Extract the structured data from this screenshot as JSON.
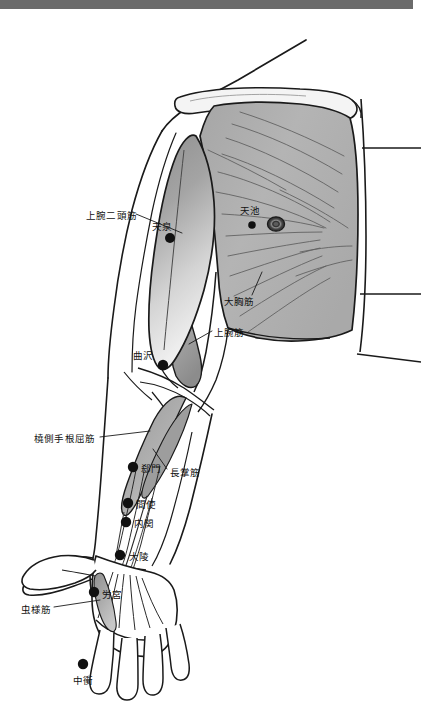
{
  "page": {
    "background_color": "#ffffff",
    "top_bar_color": "#6b6b6b",
    "width": 421,
    "height": 712
  },
  "colors": {
    "outline": "#1a1a1a",
    "muscle_gray": "#b0b0b0",
    "muscle_gray_dark": "#8d8d8d",
    "muscle_gray_light": "#cfcfcf",
    "biceps_top": "#9a9a9a",
    "biceps_bottom": "#e8e8e8",
    "point_fill": "#111111",
    "label_text": "#111111"
  },
  "figure": {
    "view": "anterior-right-upper-limb-and-chest"
  },
  "muscle_labels": [
    {
      "id": "biceps-brachii",
      "text": "上腕二頭筋",
      "text_x": 86,
      "text_y": 216,
      "anchor": "start",
      "leader": [
        [
          135,
          214
        ],
        [
          182,
          232
        ]
      ]
    },
    {
      "id": "pectoralis-major",
      "text": "大胸筋",
      "text_x": 224,
      "text_y": 302,
      "anchor": "start",
      "leader": [
        [
          253,
          296
        ],
        [
          262,
          272
        ]
      ]
    },
    {
      "id": "brachialis",
      "text": "上腕筋",
      "text_x": 214,
      "text_y": 334,
      "anchor": "start",
      "leader": [
        [
          211,
          332
        ],
        [
          188,
          345
        ]
      ]
    },
    {
      "id": "flexor-carpi-radialis",
      "text": "橈側手根屈筋",
      "text_x": 34,
      "text_y": 440,
      "anchor": "start",
      "leader": [
        [
          100,
          437
        ],
        [
          148,
          432
        ]
      ]
    },
    {
      "id": "palmaris-longus",
      "text": "長掌筋",
      "text_x": 168,
      "text_y": 474,
      "anchor": "start",
      "leader": [
        [
          166,
          470
        ],
        [
          152,
          450
        ]
      ]
    },
    {
      "id": "lumbricals",
      "text": "虫様筋",
      "text_x": 21,
      "text_y": 611,
      "anchor": "start",
      "leader": [
        [
          53,
          607
        ],
        [
          97,
          600
        ]
      ]
    }
  ],
  "acupoints": [
    {
      "id": "PC2",
      "name": "天泉",
      "cx": 170,
      "cy": 238,
      "r": 5.0,
      "label_x": 152,
      "label_y": 231,
      "label_anchor": "start"
    },
    {
      "id": "PC1",
      "name": "天池",
      "cx": 252,
      "cy": 225,
      "r": 3.8,
      "label_x": 240,
      "label_y": 215,
      "label_anchor": "start"
    },
    {
      "id": "PC3",
      "name": "曲沢",
      "cx": 163,
      "cy": 365,
      "r": 5.2,
      "label_x": 133,
      "label_y": 357,
      "label_anchor": "start"
    },
    {
      "id": "PC4",
      "name": "郄門",
      "cx": 133,
      "cy": 467,
      "r": 5.2,
      "label_x": 141,
      "label_y": 472,
      "label_anchor": "start"
    },
    {
      "id": "PC5",
      "name": "間使",
      "cx": 128,
      "cy": 503,
      "r": 5.2,
      "label_x": 136,
      "label_y": 508,
      "label_anchor": "start"
    },
    {
      "id": "PC6",
      "name": "内関",
      "cx": 126,
      "cy": 522,
      "r": 5.2,
      "label_x": 134,
      "label_y": 527,
      "label_anchor": "start"
    },
    {
      "id": "PC7",
      "name": "大陵",
      "cx": 120,
      "cy": 555,
      "r": 5.2,
      "label_x": 129,
      "label_y": 560,
      "label_anchor": "start"
    },
    {
      "id": "PC8",
      "name": "労宮",
      "cx": 94,
      "cy": 592,
      "r": 5.2,
      "label_x": 102,
      "label_y": 598,
      "label_anchor": "start"
    },
    {
      "id": "PC9",
      "name": "中衝",
      "cx": 83,
      "cy": 664,
      "r": 5.2,
      "label_x": 83,
      "label_y": 683,
      "label_anchor": "middle"
    }
  ],
  "nipple": {
    "id": "nipple",
    "cx": 276,
    "cy": 224,
    "rx": 8.5,
    "ry": 7.0
  }
}
